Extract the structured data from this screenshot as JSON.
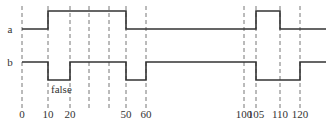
{
  "signals": [
    {
      "name": "a",
      "label": "a",
      "baseline_y": 29,
      "high_y": 11,
      "segments": [
        [
          22,
          "low"
        ],
        [
          48,
          "high"
        ],
        [
          126,
          "low"
        ],
        [
          256,
          "high"
        ],
        [
          280,
          "low"
        ],
        [
          326,
          "end"
        ]
      ]
    },
    {
      "name": "b",
      "label": "b",
      "baseline_y": 80,
      "high_y": 62,
      "segments": [
        [
          22,
          "high"
        ],
        [
          48,
          "low"
        ],
        [
          70,
          "high"
        ],
        [
          126,
          "low"
        ],
        [
          146,
          "high"
        ],
        [
          256,
          "low"
        ],
        [
          300,
          "high"
        ],
        [
          326,
          "end"
        ]
      ]
    }
  ],
  "annotation": {
    "text": "false",
    "x": 51,
    "y": 93
  },
  "dashed_lines": [
    {
      "x": 22,
      "label": "0"
    },
    {
      "x": 48,
      "label": "10"
    },
    {
      "x": 70,
      "label": "20"
    },
    {
      "x": 89,
      "label": ""
    },
    {
      "x": 109,
      "label": ""
    },
    {
      "x": 126,
      "label": "50"
    },
    {
      "x": 146,
      "label": "60"
    },
    {
      "x": 244,
      "label": "100"
    },
    {
      "x": 256,
      "label": "105"
    },
    {
      "x": 280,
      "label": "110"
    },
    {
      "x": 300,
      "label": "120"
    }
  ],
  "tick_label_y": 118
}
